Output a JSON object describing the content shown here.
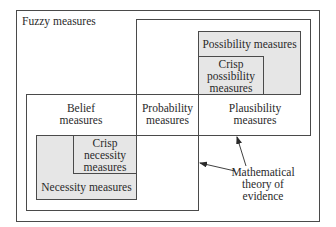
{
  "diagram": {
    "outer": {
      "label": "Fuzzy measures"
    },
    "belief": {
      "lines": [
        "Belief",
        "measures"
      ]
    },
    "probability": {
      "lines": [
        "Probability",
        "measures"
      ]
    },
    "plausibility": {
      "lines": [
        "Plausibility",
        "measures"
      ]
    },
    "possibility": {
      "label": "Possibility measures"
    },
    "crisp_possibility": {
      "lines": [
        "Crisp",
        "possibility",
        "measures"
      ]
    },
    "necessity": {
      "label": "Necessity measures"
    },
    "crisp_necessity": {
      "lines": [
        "Crisp",
        "necessity",
        "measures"
      ]
    },
    "annotation": {
      "lines": [
        "Mathematical",
        "theory of",
        "evidence"
      ]
    }
  }
}
